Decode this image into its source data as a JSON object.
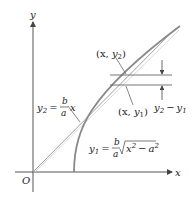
{
  "diagram": {
    "axes": {
      "x_label": "x",
      "y_label": "y",
      "origin_label": "O"
    },
    "asymptote": {
      "lhs": "y",
      "lhs_sub": "2",
      "eq": "=",
      "num": "b",
      "den": "a",
      "var": "x"
    },
    "hyperbola": {
      "lhs": "y",
      "lhs_sub": "1",
      "eq": "=",
      "num": "b",
      "den": "a",
      "radicand_x": "x",
      "radicand_exp": "2",
      "minus": "−",
      "radicand_a": "a",
      "radicand_a_exp": "2"
    },
    "points": {
      "upper": {
        "open": "(x, ",
        "var": "y",
        "sub": "2",
        "close": ")"
      },
      "lower": {
        "open": "(x, ",
        "var": "y",
        "sub": "1",
        "close": ")"
      }
    },
    "difference": {
      "a": "y",
      "a_sub": "2",
      "minus": "−",
      "b": "y",
      "b_sub": "1"
    },
    "colors": {
      "axis": "#555555",
      "curve": "#888888",
      "asymptote": "#9a9a9a",
      "text": "#222222"
    }
  }
}
